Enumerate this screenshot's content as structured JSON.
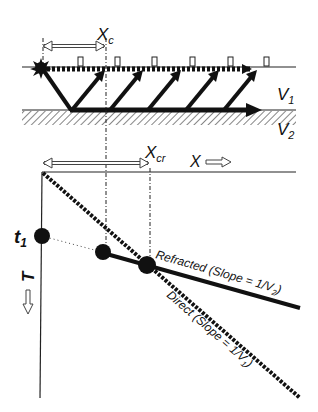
{
  "diagram": {
    "top_panel": {
      "labels": {
        "critical_distance": "X",
        "critical_distance_sub": "c",
        "upper_velocity": "V",
        "upper_velocity_sub": "1",
        "lower_velocity": "V",
        "lower_velocity_sub": "2"
      },
      "geophone_count": 6,
      "refracted_ray_count": 5
    },
    "bottom_panel": {
      "labels": {
        "crossover_distance": "X",
        "crossover_distance_sub": "cr",
        "x_axis": "X",
        "t_axis": "T",
        "intercept_time": "t",
        "intercept_time_sub": "1",
        "refracted_line": "Refracted (Slope = 1/V",
        "refracted_line_sub": "2",
        "refracted_line_end": ")",
        "direct_line": "Direct (Slope = 1/V",
        "direct_line_sub": "1",
        "direct_line_end": ")"
      }
    },
    "colors": {
      "ink": "#111111",
      "background": "#ffffff",
      "arrow_outline": "#444444"
    }
  }
}
